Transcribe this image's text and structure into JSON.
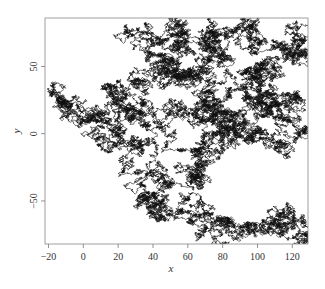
{
  "chart_data": {
    "type": "line",
    "title": "",
    "xlabel": "x",
    "ylabel": "y",
    "xlim": [
      -22,
      129
    ],
    "ylim": [
      -82,
      86
    ],
    "x_ticks": [
      -20,
      0,
      20,
      40,
      60,
      80,
      100,
      120
    ],
    "y_ticks": [
      -50,
      0,
      50
    ],
    "x_tick_labels": [
      "−20",
      "0",
      "20",
      "40",
      "60",
      "80",
      "100",
      "120"
    ],
    "y_tick_labels": [
      "−50",
      "0",
      "50"
    ],
    "grid": false,
    "legend": null,
    "line_color": "#111111",
    "series": [
      {
        "name": "random walk path (approximate waypoints)",
        "x": [
          -20,
          -12,
          -5,
          0,
          8,
          12,
          20,
          28,
          34,
          40,
          35,
          25,
          30,
          40,
          52,
          58,
          60,
          52,
          48,
          56,
          66,
          74,
          80,
          90,
          100,
          110,
          122,
          128,
          120,
          110,
          100,
          95,
          85,
          78,
          70,
          62,
          58,
          68,
          80,
          92,
          100,
          108,
          118,
          126,
          122,
          112,
          100,
          90,
          80,
          72,
          62,
          54,
          48,
          40,
          34,
          44,
          56,
          66,
          76,
          86,
          96,
          104,
          112,
          118,
          124,
          128
        ],
        "y": [
          28,
          24,
          16,
          10,
          8,
          4,
          0,
          -8,
          -12,
          -4,
          8,
          20,
          40,
          60,
          72,
          80,
          70,
          55,
          45,
          40,
          44,
          62,
          74,
          80,
          76,
          70,
          68,
          60,
          56,
          50,
          48,
          40,
          30,
          26,
          22,
          18,
          12,
          8,
          6,
          10,
          2,
          -6,
          10,
          24,
          28,
          20,
          12,
          -2,
          -12,
          -22,
          -30,
          -36,
          -40,
          -44,
          -48,
          -52,
          -56,
          -60,
          -64,
          -70,
          -74,
          -66,
          -58,
          -70,
          -78,
          -82
        ]
      }
    ]
  },
  "axes": {
    "xlabel": "x",
    "ylabel": "y"
  }
}
